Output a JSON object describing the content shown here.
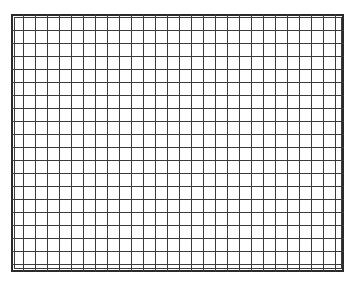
{
  "grid": {
    "outer": {
      "left": 11,
      "top": 14,
      "right": 344,
      "bottom": 272
    },
    "inner": {
      "left": 14,
      "top": 17,
      "right": 342,
      "bottom": 269
    },
    "columns": [
      23,
      35,
      47,
      59,
      71,
      83,
      95,
      107,
      119,
      131,
      143,
      155,
      167,
      179,
      191,
      203,
      215,
      227,
      239,
      251,
      263,
      275,
      287,
      299,
      311,
      323,
      335
    ],
    "rows": [
      30,
      43,
      56,
      69,
      82,
      95,
      108,
      121,
      134,
      147,
      160,
      173,
      186,
      199,
      212,
      225,
      238,
      251,
      264
    ],
    "line_color": "#3a3a3a",
    "border_color": "#2a2a2a"
  }
}
